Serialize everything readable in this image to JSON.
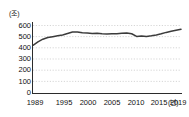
{
  "chart_data": {
    "type": "line",
    "title": "",
    "subtitle": "",
    "xlabel": "년",
    "ylabel": "조",
    "unit_label": "(조)",
    "x_unit_label": "(년)",
    "grid": true,
    "legend": "none",
    "xlim": [
      1989,
      2019
    ],
    "ylim": [
      0,
      600
    ],
    "y_ticks": [
      "0",
      "100",
      "200",
      "300",
      "400",
      "500",
      "600"
    ],
    "y_tick_values": [
      0,
      100,
      200,
      300,
      400,
      500,
      600
    ],
    "x_ticks": [
      "1989",
      "1995",
      "2000",
      "2005",
      "2010",
      "2015",
      "2019"
    ],
    "x_tick_values": [
      1989,
      1995,
      2000,
      2005,
      2010,
      2015,
      2019
    ],
    "x": [
      1989,
      1990,
      1991,
      1992,
      1993,
      1994,
      1995,
      1996,
      1997,
      1998,
      1999,
      2000,
      2001,
      2002,
      2003,
      2004,
      2005,
      2006,
      2007,
      2008,
      2009,
      2010,
      2011,
      2012,
      2013,
      2014,
      2015,
      2016,
      2017,
      2018,
      2019
    ],
    "values": [
      415,
      445,
      468,
      482,
      490,
      497,
      505,
      518,
      530,
      531,
      523,
      521,
      518,
      520,
      516,
      514,
      515,
      516,
      519,
      522,
      515,
      492,
      496,
      492,
      497,
      505,
      515,
      527,
      537,
      546,
      554
    ],
    "series": [
      {
        "name": "",
        "color": "#3b3b3b",
        "values": [
          415,
          445,
          468,
          482,
          490,
          497,
          505,
          518,
          530,
          531,
          523,
          521,
          518,
          520,
          516,
          514,
          515,
          516,
          519,
          522,
          515,
          492,
          496,
          492,
          497,
          505,
          515,
          527,
          537,
          546,
          554
        ]
      }
    ],
    "colors": {
      "line": "#3b3b3b",
      "grid": "#c9c9c9",
      "axis": "#2b2b2b",
      "text": "#111111",
      "background": "#ffffff"
    }
  },
  "axis": {
    "x_last_label_suffix": "(년)"
  }
}
